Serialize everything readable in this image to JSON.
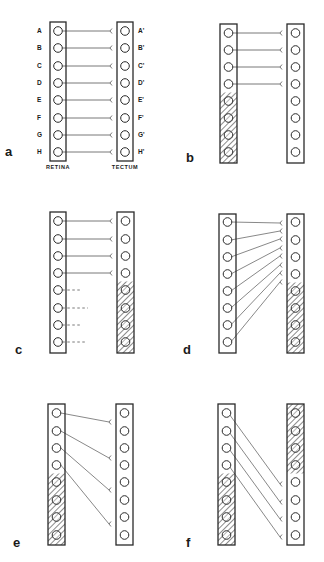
{
  "figure": {
    "retina_label": "RETINA",
    "tectum_label": "TECTUM",
    "retina_row_labels": [
      "A",
      "B",
      "C",
      "D",
      "E",
      "F",
      "G",
      "H"
    ],
    "tectum_row_labels": [
      "A'",
      "B'",
      "C'",
      "D'",
      "E'",
      "F'",
      "G'",
      "H'"
    ],
    "colors": {
      "ink": "#2a2a2a",
      "line": "#555555",
      "background": "#ffffff"
    },
    "panels": [
      {
        "id": "a",
        "letter": "a",
        "letter_pos": [
          5,
          156
        ],
        "retina": {
          "x": 50,
          "y": 22,
          "w": 16,
          "h": 139,
          "hatch": null
        },
        "tectum": {
          "x": 117,
          "y": 22,
          "w": 16,
          "h": 139,
          "hatch": null
        },
        "row_y": [
          31,
          48,
          66,
          83,
          100,
          118,
          135,
          152
        ],
        "show_labels": true,
        "connections": [
          [
            0,
            0
          ],
          [
            1,
            1
          ],
          [
            2,
            2
          ],
          [
            3,
            3
          ],
          [
            4,
            4
          ],
          [
            5,
            5
          ],
          [
            6,
            6
          ],
          [
            7,
            7
          ]
        ],
        "dashed": []
      },
      {
        "id": "b",
        "letter": "b",
        "letter_pos": [
          186,
          162
        ],
        "retina": {
          "x": 220,
          "y": 24,
          "w": 17,
          "h": 139,
          "hatch": [
            4,
            8
          ]
        },
        "tectum": {
          "x": 287,
          "y": 24,
          "w": 17,
          "h": 139,
          "hatch": null
        },
        "row_y": [
          33,
          50,
          67,
          84,
          101,
          118,
          135,
          152
        ],
        "show_labels": false,
        "connections": [
          [
            0,
            0
          ],
          [
            1,
            1
          ],
          [
            2,
            2
          ],
          [
            3,
            3
          ]
        ],
        "dashed": []
      },
      {
        "id": "c",
        "letter": "c",
        "letter_pos": [
          15,
          354
        ],
        "retina": {
          "x": 50,
          "y": 212,
          "w": 16,
          "h": 141,
          "hatch": null
        },
        "tectum": {
          "x": 117,
          "y": 212,
          "w": 17,
          "h": 141,
          "hatch": [
            4,
            8
          ]
        },
        "row_y": [
          221,
          239,
          256,
          273,
          290,
          308,
          325,
          342
        ],
        "show_labels": false,
        "connections": [
          [
            0,
            0
          ],
          [
            1,
            1
          ],
          [
            2,
            2
          ],
          [
            3,
            3
          ]
        ],
        "dashed": [
          [
            4,
            80
          ],
          [
            5,
            88
          ],
          [
            6,
            80
          ],
          [
            7,
            86
          ]
        ]
      },
      {
        "id": "d",
        "letter": "d",
        "letter_pos": [
          183,
          354
        ],
        "retina": {
          "x": 219,
          "y": 214,
          "w": 17,
          "h": 139,
          "hatch": null
        },
        "tectum": {
          "x": 287,
          "y": 214,
          "w": 17,
          "h": 139,
          "hatch": [
            4,
            8
          ]
        },
        "row_y": [
          222,
          240,
          257,
          274,
          291,
          308,
          325,
          342
        ],
        "tectum_row_y": [
          222,
          240,
          257,
          274,
          291,
          308,
          325,
          342
        ],
        "show_labels": false,
        "fan_targets": [
          223,
          231,
          239,
          248,
          256,
          265,
          273,
          282
        ],
        "connections": [],
        "dashed": []
      },
      {
        "id": "e",
        "letter": "e",
        "letter_pos": [
          13,
          547
        ],
        "retina": {
          "x": 48,
          "y": 404,
          "w": 17,
          "h": 141,
          "hatch": [
            4,
            8
          ]
        },
        "tectum": {
          "x": 116,
          "y": 404,
          "w": 17,
          "h": 141,
          "hatch": null
        },
        "row_y": [
          413,
          431,
          448,
          465,
          482,
          500,
          517,
          535
        ],
        "show_labels": false,
        "spread_targets": [
          [
            0,
            422
          ],
          [
            1,
            458
          ],
          [
            2,
            490
          ],
          [
            3,
            524
          ]
        ],
        "connections": [],
        "dashed": []
      },
      {
        "id": "f",
        "letter": "f",
        "letter_pos": [
          186,
          547
        ],
        "retina": {
          "x": 218,
          "y": 404,
          "w": 17,
          "h": 141,
          "hatch": [
            4,
            8
          ]
        },
        "tectum": {
          "x": 287,
          "y": 404,
          "w": 17,
          "h": 141,
          "hatch": [
            0,
            4
          ]
        },
        "row_y": [
          413,
          431,
          448,
          465,
          482,
          500,
          517,
          535
        ],
        "show_labels": false,
        "shift_connections": [
          [
            0,
            4
          ],
          [
            1,
            5
          ],
          [
            2,
            6
          ],
          [
            3,
            7
          ]
        ],
        "connections": [],
        "dashed": []
      }
    ]
  }
}
